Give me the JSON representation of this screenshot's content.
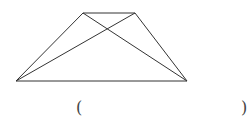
{
  "figure": {
    "type": "trapezoid-with-diagonals",
    "stroke_color": "#333333",
    "vertices": {
      "top_left": [
        83,
        13
      ],
      "top_right": [
        135,
        13
      ],
      "bottom_right": [
        187,
        81
      ],
      "bottom_left": [
        16,
        81
      ]
    }
  },
  "answer": {
    "open_paren": "(",
    "close_paren": ")",
    "value": ""
  }
}
